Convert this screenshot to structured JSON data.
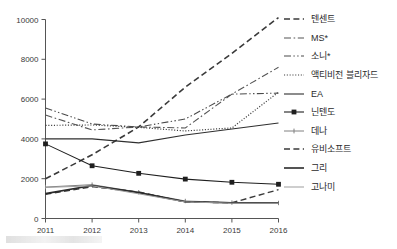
{
  "chart_data": {
    "type": "line",
    "title": "",
    "xlabel": "",
    "ylabel": "",
    "x": [
      2011,
      2012,
      2013,
      2014,
      2015,
      2016
    ],
    "categories": [
      "2011",
      "2012",
      "2013",
      "2014",
      "2015",
      "2016"
    ],
    "ylim": [
      0,
      10000
    ],
    "yticks": [
      0,
      2000,
      4000,
      6000,
      8000,
      10000
    ],
    "ytick_labels": [
      "0",
      "2000",
      "4000",
      "6000",
      "8000",
      "10000"
    ],
    "grid": false,
    "legend_position": "right",
    "series": [
      {
        "name": "텐센트",
        "style": "dashed",
        "color": "#3a3a3a",
        "width": 1.6,
        "marker": "none",
        "values": [
          2000,
          3200,
          4600,
          6600,
          8300,
          10100
        ]
      },
      {
        "name": "MS*",
        "style": "dashdot",
        "color": "#555555",
        "width": 1.1,
        "marker": "none",
        "values": [
          5200,
          4450,
          4600,
          4550,
          6250,
          7600
        ]
      },
      {
        "name": "소니*",
        "style": "dashdotdot",
        "color": "#4a4a4a",
        "width": 1.1,
        "marker": "none",
        "values": [
          5550,
          4750,
          4600,
          5000,
          6250,
          6300
        ]
      },
      {
        "name": "액티비전 블리자드",
        "style": "dotted",
        "color": "#3f3f3f",
        "width": 1.2,
        "marker": "none",
        "values": [
          4680,
          4700,
          4580,
          4400,
          4550,
          6350
        ]
      },
      {
        "name": "EA",
        "style": "solid",
        "color": "#2f2f2f",
        "width": 1.1,
        "marker": "none",
        "values": [
          4000,
          4000,
          3800,
          4200,
          4500,
          4800
        ]
      },
      {
        "name": "닌텐도",
        "style": "solid",
        "color": "#1f1f1f",
        "width": 1.1,
        "marker": "square",
        "values": [
          3750,
          2650,
          2270,
          1980,
          1820,
          1720
        ]
      },
      {
        "name": "데나",
        "style": "solid",
        "color": "#808080",
        "width": 1.0,
        "marker": "tick",
        "values": [
          1580,
          1700,
          1320,
          880,
          800,
          780
        ]
      },
      {
        "name": "유비소프트",
        "style": "dashed",
        "color": "#3a3a3a",
        "width": 1.4,
        "marker": "none",
        "values": [
          1220,
          1600,
          1330,
          830,
          790,
          1450
        ]
      },
      {
        "name": "그리",
        "style": "solid",
        "color": "#2a2a2a",
        "width": 1.6,
        "marker": "none",
        "values": [
          1250,
          1660,
          1300,
          840,
          790,
          780
        ]
      },
      {
        "name": "고나미",
        "style": "solid",
        "color": "#9d9d9d",
        "width": 1.0,
        "marker": "none",
        "values": [
          1560,
          1640,
          1240,
          830,
          770,
          760
        ]
      }
    ],
    "annotations": [
      {
        "name": "ubisoft-2014-dip",
        "text": ""
      }
    ]
  },
  "legend": {
    "items": [
      {
        "label": "텐센트"
      },
      {
        "label": "MS*"
      },
      {
        "label": "소니*"
      },
      {
        "label": "액티비전 블리자드"
      },
      {
        "label": "EA"
      },
      {
        "label": "닌텐도"
      },
      {
        "label": "데나"
      },
      {
        "label": "유비소프트"
      },
      {
        "label": "그리"
      },
      {
        "label": "고나미"
      }
    ]
  },
  "axes": {
    "y_tick_labels": [
      "10000",
      "8000",
      "6000",
      "4000",
      "2000",
      "0"
    ],
    "x_tick_labels": [
      "2011",
      "2012",
      "2013",
      "2014",
      "2015",
      "2016"
    ]
  }
}
